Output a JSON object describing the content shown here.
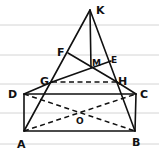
{
  "diagram": {
    "type": "geometry-pyramid-figure",
    "labels": {
      "K": "K",
      "F": "F",
      "M": "M",
      "E": "E",
      "G": "G",
      "H": "H",
      "D": "D",
      "C": "C",
      "O": "O",
      "A": "A",
      "B": "B"
    },
    "points": {
      "K": [
        90,
        10
      ],
      "F": [
        68,
        53
      ],
      "X": [
        91,
        68
      ],
      "G": [
        52,
        82
      ],
      "H": [
        117,
        82
      ],
      "D": [
        24,
        94
      ],
      "C": [
        136,
        94
      ],
      "A": [
        24,
        131
      ],
      "B": [
        135,
        131
      ],
      "O": [
        80,
        113
      ]
    },
    "solid_segments": [
      [
        "K",
        "A"
      ],
      [
        "K",
        "B"
      ],
      [
        "K",
        "X"
      ],
      [
        "D",
        "C"
      ],
      [
        "A",
        "B"
      ],
      [
        "D",
        "A"
      ],
      [
        "C",
        "B"
      ],
      [
        "D",
        "G"
      ],
      [
        "C",
        "H"
      ],
      [
        "F",
        "H"
      ],
      [
        "G",
        "X"
      ]
    ],
    "dashed_segments": [
      [
        "G",
        "H"
      ],
      [
        "D",
        "B"
      ],
      [
        "A",
        "C"
      ]
    ],
    "colors": {
      "ink": "#111111",
      "ruled_lines": "#c9c9c9",
      "background": "#ffffff"
    },
    "ruled_lines_y": [
      25,
      55,
      84,
      113,
      144
    ]
  }
}
